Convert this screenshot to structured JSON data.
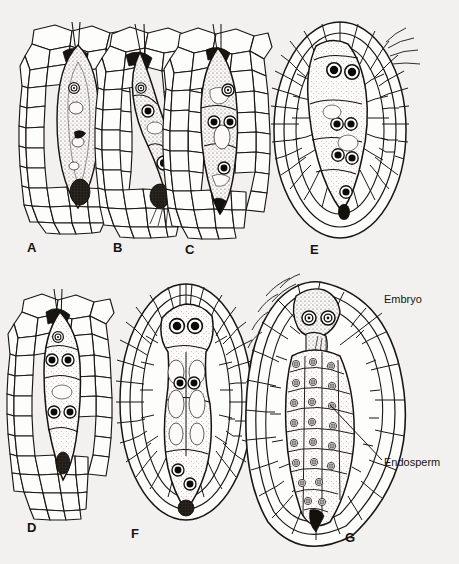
{
  "figure": {
    "kind": "botanical-line-drawing",
    "background_color": "#f2f1ef",
    "ink_color": "#1a1713",
    "panel_letters": [
      {
        "id": "A",
        "label": "A",
        "x": 27,
        "y": 248
      },
      {
        "id": "B",
        "label": "B",
        "x": 113,
        "y": 248
      },
      {
        "id": "C",
        "label": "C",
        "x": 185,
        "y": 250
      },
      {
        "id": "D",
        "label": "D",
        "x": 27,
        "y": 528
      },
      {
        "id": "E",
        "label": "E",
        "x": 310,
        "y": 250
      },
      {
        "id": "F",
        "label": "F",
        "x": 131,
        "y": 534
      },
      {
        "id": "G",
        "label": "G",
        "x": 345,
        "y": 538
      }
    ],
    "callouts": [
      {
        "id": "embryo",
        "label": "Embryo",
        "text_x": 384,
        "text_y": 303,
        "leader": {
          "x1": 382,
          "y1": 313,
          "x2": 340,
          "y2": 345
        }
      },
      {
        "id": "endosperm",
        "label": "Endosperm",
        "text_x": 384,
        "text_y": 463,
        "leader": {
          "x1": 382,
          "y1": 460,
          "x2": 330,
          "y2": 405
        }
      }
    ],
    "panels": [
      {
        "id": "A",
        "caption_letter": "A",
        "stage": "Fertilized egg / zygote in embryo sac",
        "sac": {
          "cx": 78,
          "cy": 125,
          "rx": 21,
          "ry": 85
        },
        "nuclei": [
          {
            "cx": 74,
            "cy": 88,
            "r": 5,
            "style": "ring"
          }
        ],
        "dark_mass": {
          "cx": 80,
          "cy": 192,
          "rx": 10,
          "ry": 13
        },
        "micropyle": {
          "x": 75,
          "y": 24
        },
        "tissue": {
          "x": 22,
          "y": 22,
          "w": 112,
          "h": 212,
          "shape": "column"
        }
      },
      {
        "id": "B",
        "caption_letter": "B",
        "stage": "Two-celled proembryo",
        "sac": {
          "cx": 152,
          "cy": 125,
          "rx": 19,
          "ry": 86
        },
        "nuclei": [
          {
            "cx": 141,
            "cy": 88,
            "r": 5,
            "style": "ring"
          },
          {
            "cx": 148,
            "cy": 111,
            "r": 6,
            "style": "solid"
          },
          {
            "cx": 164,
            "cy": 163,
            "r": 7,
            "style": "solid"
          }
        ],
        "dark_mass": {
          "cx": 160,
          "cy": 196,
          "rx": 10,
          "ry": 12
        },
        "micropyle": {
          "x": 136,
          "y": 26
        },
        "tissue": {
          "x": 104,
          "y": 22,
          "w": 100,
          "h": 216,
          "shape": "column"
        }
      },
      {
        "id": "C",
        "caption_letter": "C",
        "stage": "Multicellular proembryo with suspensor",
        "sac": {
          "cx": 220,
          "cy": 125,
          "rx": 20,
          "ry": 88
        },
        "nuclei": [
          {
            "cx": 228,
            "cy": 90,
            "r": 6,
            "style": "ring"
          },
          {
            "cx": 214,
            "cy": 122,
            "r": 6,
            "style": "solid"
          },
          {
            "cx": 230,
            "cy": 122,
            "r": 6,
            "style": "solid"
          },
          {
            "cx": 224,
            "cy": 168,
            "r": 6,
            "style": "solid"
          }
        ],
        "dark_mass": {
          "cx": 219,
          "cy": 206,
          "rx": 7,
          "ry": 9
        },
        "micropyle": {
          "x": 216,
          "y": 26
        },
        "tissue": {
          "x": 170,
          "y": 22,
          "w": 104,
          "h": 212,
          "shape": "column"
        }
      },
      {
        "id": "D",
        "caption_letter": "D",
        "stage": "Elongating proembryo, free-nuclear endosperm",
        "sac": {
          "cx": 62,
          "cy": 395,
          "rx": 20,
          "ry": 88
        },
        "nuclei": [
          {
            "cx": 58,
            "cy": 337,
            "r": 5,
            "style": "ring"
          },
          {
            "cx": 52,
            "cy": 360,
            "r": 6,
            "style": "solid"
          },
          {
            "cx": 68,
            "cy": 360,
            "r": 6,
            "style": "solid"
          },
          {
            "cx": 54,
            "cy": 412,
            "r": 6,
            "style": "solid"
          },
          {
            "cx": 70,
            "cy": 412,
            "r": 6,
            "style": "solid"
          }
        ],
        "dark_mass": {
          "cx": 63,
          "cy": 463,
          "rx": 7,
          "ry": 11
        },
        "micropyle": {
          "x": 56,
          "y": 291
        },
        "tissue": {
          "x": 18,
          "y": 288,
          "w": 96,
          "h": 222,
          "shape": "column"
        }
      },
      {
        "id": "E",
        "caption_letter": "E",
        "stage": "Whole ovule with enlarged embryo sac",
        "sac": {
          "cx": 342,
          "cy": 132,
          "rx": 22,
          "ry": 80
        },
        "nuclei": [
          {
            "cx": 334,
            "cy": 70,
            "r": 7,
            "style": "solid"
          },
          {
            "cx": 352,
            "cy": 72,
            "r": 7,
            "style": "solid"
          },
          {
            "cx": 337,
            "cy": 124,
            "r": 6,
            "style": "solid"
          },
          {
            "cx": 351,
            "cy": 124,
            "r": 6,
            "style": "solid"
          },
          {
            "cx": 338,
            "cy": 155,
            "r": 6,
            "style": "solid"
          },
          {
            "cx": 352,
            "cy": 158,
            "r": 6,
            "style": "solid"
          },
          {
            "cx": 346,
            "cy": 192,
            "r": 6,
            "style": "solid"
          }
        ],
        "dark_mass": {
          "cx": 344,
          "cy": 212,
          "rx": 6,
          "ry": 8
        },
        "ovule": {
          "cx": 340,
          "cy": 130,
          "rx": 66,
          "ry": 108
        },
        "has_integument_hairs": true
      },
      {
        "id": "F",
        "caption_letter": "F",
        "stage": "Ovule with globular embryo and endosperm",
        "sac": {
          "cx": 186,
          "cy": 405,
          "rx": 24,
          "ry": 98
        },
        "nuclei": [
          {
            "cx": 177,
            "cy": 326,
            "r": 7,
            "style": "solid"
          },
          {
            "cx": 195,
            "cy": 326,
            "r": 7,
            "style": "solid"
          },
          {
            "cx": 180,
            "cy": 383,
            "r": 6,
            "style": "solid"
          },
          {
            "cx": 194,
            "cy": 383,
            "r": 6,
            "style": "solid"
          },
          {
            "cx": 178,
            "cy": 470,
            "r": 6,
            "style": "solid"
          },
          {
            "cx": 190,
            "cy": 484,
            "r": 6,
            "style": "solid"
          }
        ],
        "dark_mass": {
          "cx": 186,
          "cy": 508,
          "rx": 8,
          "ry": 8
        },
        "ovule": {
          "cx": 186,
          "cy": 402,
          "rx": 66,
          "ry": 118
        }
      },
      {
        "id": "G",
        "caption_letter": "G",
        "stage": "Mature seed: embryo with cellular endosperm",
        "sac": {
          "cx": 320,
          "cy": 420,
          "rx": 34,
          "ry": 108
        },
        "nuclei": [
          {
            "cx": 309,
            "cy": 318,
            "r": 7,
            "style": "ring"
          },
          {
            "cx": 328,
            "cy": 318,
            "r": 7,
            "style": "ring"
          }
        ],
        "endosperm_cell_count": 34,
        "dark_mass": {
          "cx": 316,
          "cy": 518,
          "rx": 7,
          "ry": 12
        },
        "ovule": {
          "cx": 320,
          "cy": 412,
          "rx": 80,
          "ry": 130
        },
        "has_integument_hairs": true
      }
    ]
  }
}
